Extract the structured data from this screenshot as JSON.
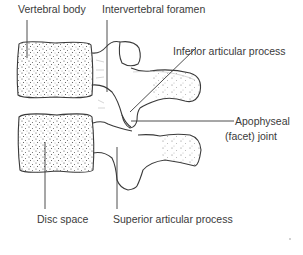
{
  "figure": {
    "labels": {
      "vertebral_body": "Vertebral body",
      "intervertebral_foramen": "Intervertebral foramen",
      "inferior_articular_process": "Inferior articular process",
      "apophyseal_joint_line1": "Apophyseal",
      "apophyseal_joint_line2": "(facet) joint",
      "disc_space": "Disc space",
      "superior_articular_process": "Superior articular process"
    },
    "colors": {
      "line": "#3a3a3a",
      "stipple": "#4a4a4a",
      "background": "#ffffff"
    }
  }
}
